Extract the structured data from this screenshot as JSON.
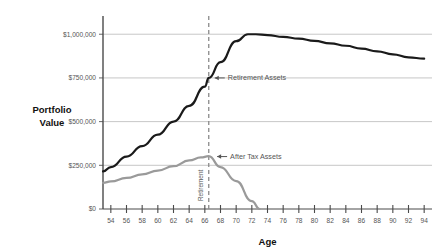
{
  "chart_data": {
    "type": "line",
    "title": "",
    "xlabel": "Age",
    "ylabel": "Portfolio Value",
    "xlim": [
      53,
      95
    ],
    "ylim": [
      0,
      1070000
    ],
    "grid": true,
    "legend_position": "inline-annotations",
    "xticks": [
      54,
      56,
      58,
      60,
      62,
      64,
      66,
      68,
      70,
      72,
      74,
      76,
      78,
      80,
      82,
      84,
      86,
      88,
      90,
      92,
      94
    ],
    "xtick_labels": [
      "54",
      "56",
      "58",
      "60",
      "62",
      "64",
      "66",
      "68",
      "70",
      "72",
      "74",
      "76",
      "78",
      "80",
      "82",
      "84",
      "86",
      "88",
      "90",
      "92",
      "94"
    ],
    "yticks": [
      0,
      250000,
      500000,
      750000,
      1000000
    ],
    "ytick_labels": [
      "$0",
      "$250,000",
      "$500,000",
      "$750,000",
      "$1,000,000"
    ],
    "series": [
      {
        "name": "Retirement Assets",
        "color": "#1a1a1a",
        "width": 2.2,
        "x": [
          53,
          54,
          56,
          58,
          60,
          62,
          64,
          66,
          66.5,
          68,
          70,
          71.5,
          72.5,
          74,
          76,
          78,
          80,
          82,
          84,
          86,
          88,
          90,
          92,
          94
        ],
        "values": [
          215000,
          240000,
          300000,
          360000,
          425000,
          500000,
          590000,
          700000,
          750000,
          840000,
          960000,
          1000000,
          1000000,
          995000,
          985000,
          975000,
          962000,
          948000,
          934000,
          918000,
          902000,
          885000,
          868000,
          860000
        ]
      },
      {
        "name": "After Tax Assets",
        "color": "#9a9a9a",
        "width": 2.2,
        "x": [
          53,
          54,
          56,
          58,
          60,
          62,
          64,
          65.5,
          66.5,
          68,
          70,
          72,
          73
        ],
        "values": [
          150000,
          158000,
          178000,
          198000,
          220000,
          245000,
          278000,
          295000,
          302000,
          240000,
          160000,
          45000,
          0
        ]
      }
    ],
    "annotations": [
      {
        "name": "retirement-assets-callout",
        "text": "Retirement Assets",
        "arrow": "left",
        "at_x": 66.5,
        "at_y": 750000
      },
      {
        "name": "after-tax-assets-callout",
        "text": "After Tax Assets",
        "arrow": "left",
        "at_x": 66.8,
        "at_y": 300000
      }
    ],
    "marker_lines": [
      {
        "name": "retirement-marker",
        "label": "Retirement",
        "x": 66.5,
        "style": "dashed",
        "color": "#8a8a8a",
        "orientation": "vertical"
      }
    ]
  }
}
